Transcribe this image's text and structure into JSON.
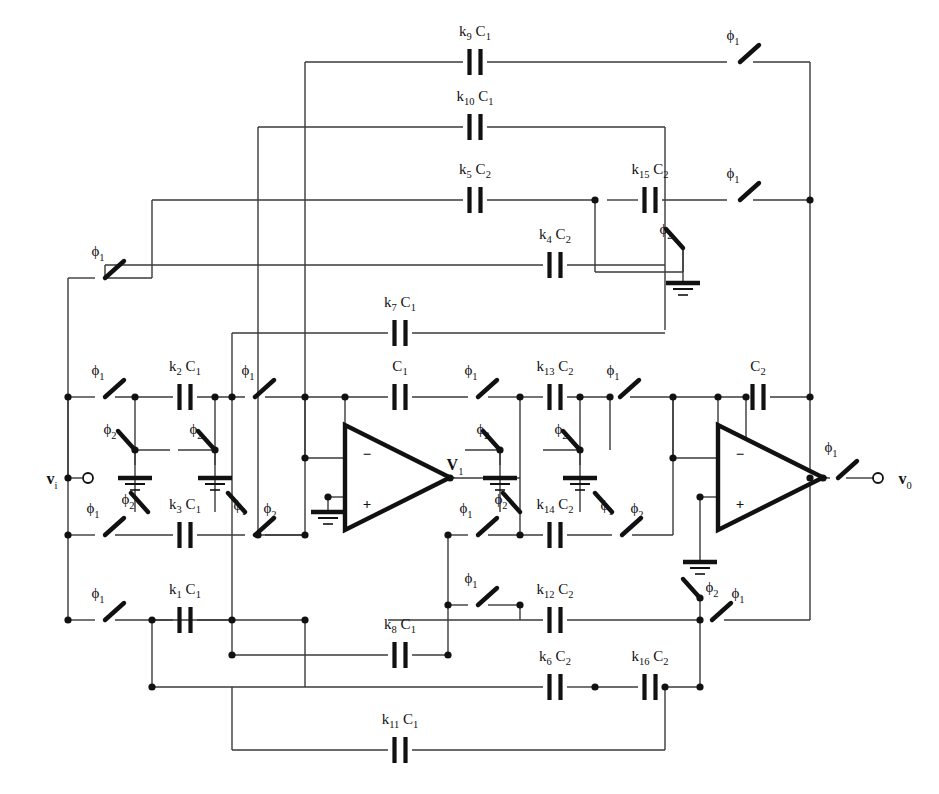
{
  "figure": {
    "kind": "circuit-diagram",
    "line_color": "#3a3a3a",
    "ink_color": "#111111",
    "background": "#ffffff"
  },
  "terminals": [
    {
      "name": "input-terminal",
      "label": "v",
      "sub": "i",
      "x": 52,
      "y": 478
    },
    {
      "name": "output-terminal",
      "label": "v",
      "sub": "0",
      "x": 905,
      "y": 478
    },
    {
      "name": "node-v1-label",
      "label": "V",
      "sub": "1",
      "x": 455,
      "y": 464
    }
  ],
  "capacitors": [
    {
      "id": "k9C1",
      "k": "k",
      "ksub": "9",
      "c": "C",
      "csub": "1",
      "x": 475,
      "y": 62,
      "orient": "h"
    },
    {
      "id": "k10C1",
      "k": "k",
      "ksub": "10",
      "c": "C",
      "csub": "1",
      "x": 475,
      "y": 127,
      "orient": "h"
    },
    {
      "id": "k5C2",
      "k": "k",
      "ksub": "5",
      "c": "C",
      "csub": "2",
      "x": 475,
      "y": 200,
      "orient": "h"
    },
    {
      "id": "k15C2",
      "k": "k",
      "ksub": "15",
      "c": "C",
      "csub": "2",
      "x": 650,
      "y": 200,
      "orient": "h"
    },
    {
      "id": "k4C2",
      "k": "k",
      "ksub": "4",
      "c": "C",
      "csub": "2",
      "x": 555,
      "y": 265,
      "orient": "h"
    },
    {
      "id": "k7C1",
      "k": "k",
      "ksub": "7",
      "c": "C",
      "csub": "1",
      "x": 400,
      "y": 333,
      "orient": "h"
    },
    {
      "id": "k2C1",
      "k": "k",
      "ksub": "2",
      "c": "C",
      "csub": "1",
      "x": 185,
      "y": 397,
      "orient": "h"
    },
    {
      "id": "C1",
      "k": "",
      "ksub": "",
      "c": "C",
      "csub": "1",
      "x": 400,
      "y": 397,
      "orient": "h"
    },
    {
      "id": "k13C2",
      "k": "k",
      "ksub": "13",
      "c": "C",
      "csub": "2",
      "x": 555,
      "y": 397,
      "orient": "h"
    },
    {
      "id": "C2",
      "k": "",
      "ksub": "",
      "c": "C",
      "csub": "2",
      "x": 758,
      "y": 397,
      "orient": "h"
    },
    {
      "id": "k3C1",
      "k": "k",
      "ksub": "3",
      "c": "C",
      "csub": "1",
      "x": 185,
      "y": 535,
      "orient": "h"
    },
    {
      "id": "k14C2",
      "k": "k",
      "ksub": "14",
      "c": "C",
      "csub": "2",
      "x": 555,
      "y": 535,
      "orient": "h"
    },
    {
      "id": "k1C1",
      "k": "k",
      "ksub": "1",
      "c": "C",
      "csub": "1",
      "x": 185,
      "y": 620,
      "orient": "h"
    },
    {
      "id": "k12C2",
      "k": "k",
      "ksub": "12",
      "c": "C",
      "csub": "2",
      "x": 555,
      "y": 620,
      "orient": "h"
    },
    {
      "id": "k8C1",
      "k": "k",
      "ksub": "8",
      "c": "C",
      "csub": "1",
      "x": 400,
      "y": 655,
      "orient": "h"
    },
    {
      "id": "k6C2",
      "k": "k",
      "ksub": "6",
      "c": "C",
      "csub": "2",
      "x": 555,
      "y": 687,
      "orient": "h"
    },
    {
      "id": "k16C2",
      "k": "k",
      "ksub": "16",
      "c": "C",
      "csub": "2",
      "x": 650,
      "y": 687,
      "orient": "h"
    },
    {
      "id": "k11C1",
      "k": "k",
      "ksub": "11",
      "c": "C",
      "csub": "1",
      "x": 400,
      "y": 750,
      "orient": "h"
    }
  ],
  "switches": [
    {
      "id": "sw-top-phi1",
      "phase": "1",
      "x": 740,
      "y": 62,
      "dir": "down-right",
      "label_x": 733,
      "label_y": 40
    },
    {
      "id": "sw-k5-row-phi1",
      "phase": "1",
      "x": 740,
      "y": 200,
      "dir": "down-right",
      "label_x": 733,
      "label_y": 178
    },
    {
      "id": "sw-k15-gnd-phi2",
      "phase": "2",
      "x": 683,
      "y": 248,
      "dir": "up-right",
      "label_x": 666,
      "label_y": 234
    },
    {
      "id": "sw-in-top-phi1",
      "phase": "1",
      "x": 105,
      "y": 278,
      "dir": "down-right",
      "label_x": 98,
      "label_y": 256
    },
    {
      "id": "sw-in-mid-phi1",
      "phase": "1",
      "x": 105,
      "y": 397,
      "dir": "down-right",
      "label_x": 98,
      "label_y": 375
    },
    {
      "id": "sw-k2-right-phi1",
      "phase": "1",
      "x": 255,
      "y": 397,
      "dir": "down-right",
      "label_x": 248,
      "label_y": 375
    },
    {
      "id": "sw-c1-right-phi1",
      "phase": "1",
      "x": 478,
      "y": 397,
      "dir": "down-right",
      "label_x": 471,
      "label_y": 375
    },
    {
      "id": "sw-k13-right-phi1",
      "phase": "1",
      "x": 620,
      "y": 397,
      "dir": "down-right",
      "label_x": 613,
      "label_y": 375
    },
    {
      "id": "sw-out-phi1",
      "phase": "1",
      "x": 838,
      "y": 478,
      "dir": "down-right",
      "label_x": 831,
      "label_y": 452
    },
    {
      "id": "sw-a-gnd-phi2",
      "phase": "2",
      "x": 135,
      "y": 450,
      "dir": "up-right",
      "label_x": 110,
      "label_y": 434
    },
    {
      "id": "sw-b-gnd-phi2",
      "phase": "2",
      "x": 215,
      "y": 450,
      "dir": "up-right",
      "label_x": 196,
      "label_y": 434
    },
    {
      "id": "sw-v1-gnd-phi2",
      "phase": "2",
      "x": 500,
      "y": 450,
      "dir": "up-right",
      "label_x": 483,
      "label_y": 434
    },
    {
      "id": "sw-k13n-gnd-phi2",
      "phase": "2",
      "x": 580,
      "y": 450,
      "dir": "up-right",
      "label_x": 561,
      "label_y": 434
    },
    {
      "id": "sw-k3-left-phi1",
      "phase": "1",
      "x": 105,
      "y": 535,
      "dir": "down-right",
      "label_x": 93,
      "label_y": 513
    },
    {
      "id": "sw-k3-left-phi2",
      "phase": "2",
      "x": 148,
      "y": 512,
      "dir": "up-right",
      "label_x": 128,
      "label_y": 504
    },
    {
      "id": "sw-k3-right-phi1",
      "phase": "1",
      "x": 245,
      "y": 512,
      "dir": "up-right",
      "label_x": 240,
      "label_y": 510
    },
    {
      "id": "sw-k3-right-phi2",
      "phase": "2",
      "x": 255,
      "y": 535,
      "dir": "down-right",
      "label_x": 270,
      "label_y": 513
    },
    {
      "id": "sw-k14-left-phi1",
      "phase": "1",
      "x": 478,
      "y": 535,
      "dir": "down-right",
      "label_x": 466,
      "label_y": 513
    },
    {
      "id": "sw-k14-left-phi2",
      "phase": "2",
      "x": 520,
      "y": 512,
      "dir": "up-right",
      "label_x": 501,
      "label_y": 504
    },
    {
      "id": "sw-k14-right-phi1",
      "phase": "1",
      "x": 612,
      "y": 512,
      "dir": "up-right",
      "label_x": 607,
      "label_y": 510
    },
    {
      "id": "sw-k14-right-phi2",
      "phase": "2",
      "x": 622,
      "y": 535,
      "dir": "down-right",
      "label_x": 637,
      "label_y": 513
    },
    {
      "id": "sw-k1-left-phi1",
      "phase": "1",
      "x": 105,
      "y": 620,
      "dir": "down-right",
      "label_x": 98,
      "label_y": 598
    },
    {
      "id": "sw-k8-right-phi1",
      "phase": "1",
      "x": 478,
      "y": 605,
      "dir": "down-right",
      "label_x": 471,
      "label_y": 583
    },
    {
      "id": "sw-fb-phi2",
      "phase": "2",
      "x": 700,
      "y": 598,
      "dir": "up-right",
      "label_x": 712,
      "label_y": 592
    },
    {
      "id": "sw-fb-phi1",
      "phase": "1",
      "x": 712,
      "y": 620,
      "dir": "down-right",
      "label_x": 738,
      "label_y": 598
    }
  ],
  "grounds": [
    {
      "id": "gnd-k15",
      "x": 683,
      "y": 283
    },
    {
      "id": "gnd-a",
      "x": 135,
      "y": 478
    },
    {
      "id": "gnd-b",
      "x": 215,
      "y": 478
    },
    {
      "id": "gnd-v1",
      "x": 500,
      "y": 478
    },
    {
      "id": "gnd-k13",
      "x": 580,
      "y": 478
    },
    {
      "id": "gnd-op1",
      "x": 328,
      "y": 512
    },
    {
      "id": "gnd-op2",
      "x": 700,
      "y": 562
    }
  ],
  "opamps": [
    {
      "id": "opamp-1",
      "x": 345,
      "y": 425,
      "w": 105,
      "h": 105,
      "minus": "−",
      "plus": "+"
    },
    {
      "id": "opamp-2",
      "x": 718,
      "y": 425,
      "w": 105,
      "h": 105,
      "minus": "−",
      "plus": "+"
    }
  ],
  "phase_symbol": "ϕ",
  "legend": {
    "phi1": "ϕ₁",
    "phi2": "ϕ₂"
  }
}
